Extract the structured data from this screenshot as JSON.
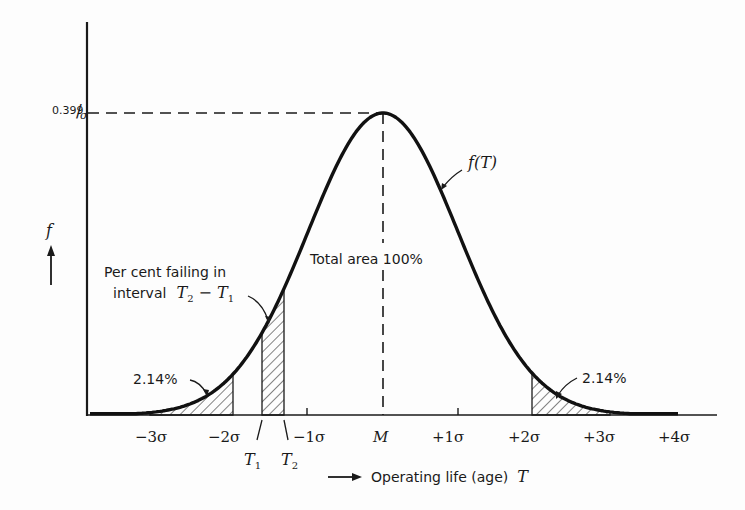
{
  "diagram": {
    "y_axis": {
      "symbol": "f",
      "peak_value_label": "0.399",
      "peak_value_denominator": "σ"
    },
    "x_axis": {
      "arrow_label": "Operating life (age)",
      "variable": "T",
      "ticks": [
        "−3σ",
        "−2σ",
        "−1σ",
        "M",
        "+1σ",
        "+2σ",
        "+3σ",
        "+4σ"
      ],
      "interval_markers": [
        {
          "name": "T",
          "sub": "1"
        },
        {
          "name": "T",
          "sub": "2"
        }
      ]
    },
    "curve_label": "f(T)",
    "annotations": {
      "total_area": "Total area 100%",
      "interval_line1": "Per cent failing in",
      "interval_line2_prefix": "interval",
      "interval_expr_a": "T",
      "interval_expr_a_sub": "2",
      "interval_expr_minus": " − ",
      "interval_expr_b": "T",
      "interval_expr_b_sub": "1",
      "left_tail": "2.14%",
      "right_tail": "2.14%"
    }
  },
  "chart_data": {
    "type": "area",
    "xlabel": "Operating life (age) T",
    "ylabel": "f",
    "x": [
      -4,
      -3,
      -2,
      -1,
      0,
      1,
      2,
      3,
      4
    ],
    "x_tick_labels": [
      "",
      "-3σ",
      "-2σ",
      "-1σ",
      "M",
      "+1σ",
      "+2σ",
      "+3σ",
      "+4σ"
    ],
    "y": [
      0.000134,
      0.00443,
      0.054,
      0.242,
      0.399,
      0.242,
      0.054,
      0.00443,
      0.000134
    ],
    "y_units": "1/σ",
    "peak": {
      "x": "M",
      "y": "0.399/σ"
    },
    "shaded_regions": [
      {
        "from": "-∞",
        "to": "-2σ",
        "label": "2.14%"
      },
      {
        "from": "T1",
        "to": "T2",
        "label": "Per cent failing in interval T2 − T1"
      },
      {
        "from": "+2σ",
        "to": "+∞",
        "label": "2.14%"
      }
    ],
    "annotations": [
      "Total area 100%",
      "f(T)"
    ],
    "grid": false
  }
}
